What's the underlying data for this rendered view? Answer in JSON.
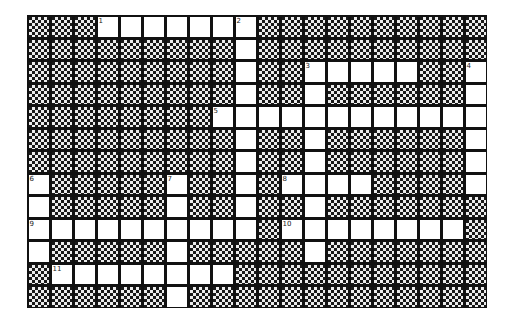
{
  "puzzle": {
    "cols": 20,
    "rows": 13,
    "colors": {
      "block": "#111111",
      "open": "#ffffff",
      "line": "#111111"
    },
    "entries": [
      {
        "number": "1",
        "direction": "across",
        "row": 0,
        "col": 3,
        "length": 7
      },
      {
        "number": "2",
        "direction": "down",
        "row": 0,
        "col": 9,
        "length": 10
      },
      {
        "number": "3",
        "direction": "across",
        "row": 2,
        "col": 12,
        "length": 5
      },
      {
        "number": "3",
        "direction": "down",
        "row": 2,
        "col": 12,
        "length": 9
      },
      {
        "number": "4",
        "direction": "down",
        "row": 2,
        "col": 19,
        "length": 6
      },
      {
        "number": "5",
        "direction": "across",
        "row": 4,
        "col": 8,
        "length": 12
      },
      {
        "number": "6",
        "direction": "down",
        "row": 7,
        "col": 0,
        "length": 4
      },
      {
        "number": "7",
        "direction": "down",
        "row": 7,
        "col": 6,
        "length": 6
      },
      {
        "number": "8",
        "direction": "across",
        "row": 7,
        "col": 11,
        "length": 4
      },
      {
        "number": "9",
        "direction": "across",
        "row": 9,
        "col": 0,
        "length": 10
      },
      {
        "number": "10",
        "direction": "across",
        "row": 9,
        "col": 11,
        "length": 8
      },
      {
        "number": "11",
        "direction": "across",
        "row": 11,
        "col": 1,
        "length": 8
      }
    ],
    "labels": [
      {
        "number": "1",
        "row": 0,
        "col": 3
      },
      {
        "number": "2",
        "row": 0,
        "col": 9
      },
      {
        "number": "3",
        "row": 2,
        "col": 12
      },
      {
        "number": "4",
        "row": 2,
        "col": 19
      },
      {
        "number": "5",
        "row": 4,
        "col": 8
      },
      {
        "number": "6",
        "row": 7,
        "col": 0
      },
      {
        "number": "7",
        "row": 7,
        "col": 6
      },
      {
        "number": "8",
        "row": 7,
        "col": 11
      },
      {
        "number": "9",
        "row": 9,
        "col": 0
      },
      {
        "number": "10",
        "row": 9,
        "col": 11
      },
      {
        "number": "11",
        "row": 11,
        "col": 1
      }
    ]
  }
}
